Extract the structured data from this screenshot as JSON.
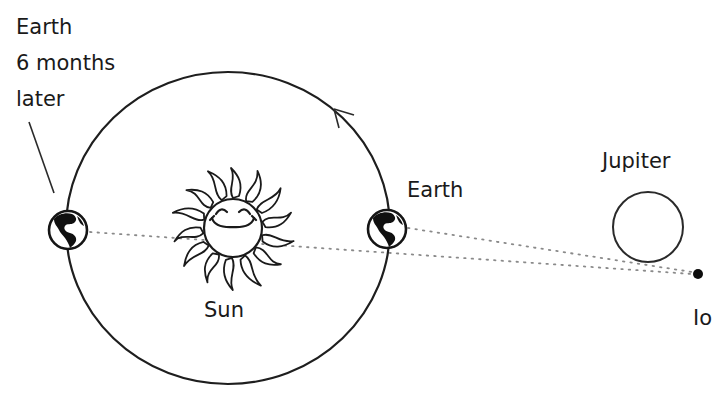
{
  "diagram": {
    "labels": {
      "earth_later_lines": [
        "Earth",
        "6 months",
        "later"
      ],
      "earth": "Earth",
      "sun": "Sun",
      "jupiter": "Jupiter",
      "io": "Io"
    },
    "objects": {
      "orbit": {
        "cx": 228,
        "cy": 228,
        "rx": 162,
        "ry": 156,
        "direction": "counter-clockwise"
      },
      "sun": {
        "cx": 233,
        "cy": 228,
        "r": 29
      },
      "earth_now": {
        "cx": 387,
        "cy": 229,
        "r": 20
      },
      "earth_6_months_later": {
        "cx": 68,
        "cy": 230,
        "r": 20
      },
      "jupiter": {
        "cx": 648,
        "cy": 227,
        "r": 35
      },
      "io": {
        "cx": 698,
        "cy": 274,
        "r": 5
      }
    },
    "lines_of_sight": [
      {
        "from": "earth_now",
        "to": "io",
        "style": "dotted"
      },
      {
        "from": "earth_6_months_later",
        "to": "io",
        "style": "dotted",
        "passes": "sun"
      }
    ],
    "colors": {
      "ink": "#1a1a1a",
      "dots": "#8a8a8a",
      "background": "#ffffff"
    }
  }
}
